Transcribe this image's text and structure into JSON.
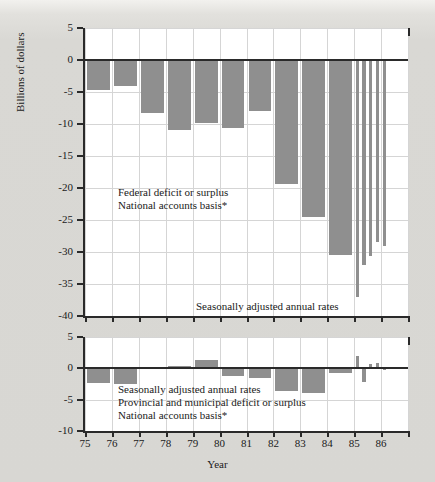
{
  "figure": {
    "ylabel": "Billions of dollars",
    "xlabel": "Year",
    "bar_color": "#8f8f8f",
    "axis_color": "#2a2a2a",
    "grid_color": "#d5d5d5",
    "plot_bg": "#ffffff",
    "page_bg": "#d9d8d4"
  },
  "top_panel": {
    "annotations": [
      "Federal deficit or surplus",
      "National accounts basis*",
      "Seasonally adjusted annual rates"
    ],
    "ytick_labels": [
      "5",
      "0",
      "-5",
      "-10",
      "-15",
      "-20",
      "-25",
      "-30",
      "-35",
      "-40"
    ]
  },
  "bottom_panel": {
    "annotations": [
      "Seasonally adjusted annual rates",
      "Provincial and municipal deficit or surplus",
      "National accounts basis*"
    ],
    "ytick_labels": [
      "5",
      "0",
      "-5",
      "-10"
    ]
  },
  "xtick_labels": [
    "75",
    "76",
    "77",
    "78",
    "79",
    "80",
    "81",
    "82",
    "83",
    "84",
    "85",
    "86"
  ],
  "chart_data": [
    {
      "type": "bar",
      "id": "federal-deficit",
      "title": "Federal deficit or surplus",
      "subtitle": "National accounts basis*",
      "note": "Seasonally adjusted annual rates",
      "xlabel": "Year",
      "ylabel": "Billions of dollars",
      "ylim": [
        -40,
        5
      ],
      "yticks": [
        5,
        0,
        -5,
        -10,
        -15,
        -20,
        -25,
        -30,
        -35,
        -40
      ],
      "xlim": [
        1975,
        1987
      ],
      "xticks": [
        75,
        76,
        77,
        78,
        79,
        80,
        81,
        82,
        83,
        84,
        85,
        86
      ],
      "grid": true,
      "legend": "none",
      "categories": [
        "75",
        "76",
        "77",
        "78",
        "79",
        "80",
        "81",
        "82",
        "83",
        "84",
        "85Q1",
        "85Q2",
        "85Q3",
        "85Q4",
        "86Q1"
      ],
      "values": [
        -4.7,
        -4.0,
        -8.2,
        -11.0,
        -9.8,
        -10.6,
        -8.0,
        -19.4,
        -24.6,
        -30.4,
        -37.0,
        -32.0,
        -30.6,
        -28.4,
        -29.1
      ]
    },
    {
      "type": "bar",
      "id": "provincial-municipal-deficit",
      "title": "Provincial and municipal deficit or surplus",
      "subtitle": "National accounts basis*",
      "note": "Seasonally adjusted annual rates",
      "xlabel": "Year",
      "ylabel": "Billions of dollars",
      "ylim": [
        -10,
        5
      ],
      "yticks": [
        5,
        0,
        -5,
        -10
      ],
      "xlim": [
        1975,
        1987
      ],
      "xticks": [
        75,
        76,
        77,
        78,
        79,
        80,
        81,
        82,
        83,
        84,
        85,
        86
      ],
      "grid": true,
      "legend": "none",
      "categories": [
        "75",
        "76",
        "77",
        "78",
        "79",
        "80",
        "81",
        "82",
        "83",
        "84",
        "85Q1",
        "85Q2",
        "85Q3",
        "85Q4",
        "86Q1"
      ],
      "values": [
        -2.4,
        -2.5,
        0.2,
        0.4,
        1.4,
        -1.2,
        -1.5,
        -3.6,
        -4.0,
        -0.8,
        2.0,
        -2.2,
        0.7,
        0.9,
        -0.3
      ]
    }
  ]
}
